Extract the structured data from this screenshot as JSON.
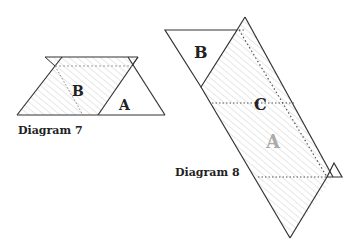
{
  "diagram7": {
    "caption": "Diagram 7",
    "labels": {
      "A": "A",
      "B": "B"
    }
  },
  "diagram8": {
    "caption": "Diagram 8",
    "labels": {
      "A": "A",
      "B": "B",
      "C": "C"
    }
  },
  "colors": {
    "stroke": "#333333",
    "hatch": "#cccccc",
    "label": "#222222",
    "faded_label": "#aaaaaa"
  }
}
